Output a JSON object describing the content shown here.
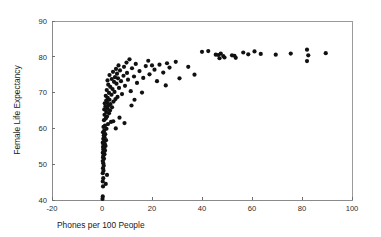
{
  "chart_data": {
    "type": "scatter",
    "title": "",
    "xlabel": "Phones per 100 People",
    "ylabel": "Female Life Expectancy",
    "xlim": [
      -20,
      100
    ],
    "ylim": [
      40,
      90
    ],
    "xticks": [
      -20,
      0,
      20,
      40,
      60,
      80,
      100
    ],
    "xticklabels": [
      "-20",
      "0",
      "20",
      "40",
      "60",
      "80",
      "100"
    ],
    "yticks": [
      40,
      50,
      60,
      70,
      80,
      90
    ],
    "yticklabels": [
      "40",
      "50",
      "60",
      "70",
      "80",
      "90"
    ],
    "grid": false,
    "legend": null,
    "marker": "filled-circle",
    "marker_color": "#111111",
    "marker_size": 2.1,
    "points": [
      [
        0.2,
        40.3
      ],
      [
        0.3,
        41.0
      ],
      [
        0.4,
        43.8
      ],
      [
        0.3,
        45.2
      ],
      [
        0.5,
        46.1
      ],
      [
        0.3,
        47.5
      ],
      [
        0.6,
        48.2
      ],
      [
        0.4,
        48.9
      ],
      [
        0.7,
        49.6
      ],
      [
        0.5,
        50.3
      ],
      [
        0.3,
        50.9
      ],
      [
        0.8,
        51.5
      ],
      [
        0.4,
        51.9
      ],
      [
        0.6,
        52.4
      ],
      [
        1.0,
        52.8
      ],
      [
        0.3,
        53.2
      ],
      [
        0.7,
        53.5
      ],
      [
        1.2,
        53.8
      ],
      [
        0.5,
        54.1
      ],
      [
        0.9,
        54.4
      ],
      [
        0.4,
        54.8
      ],
      [
        1.4,
        55.1
      ],
      [
        0.6,
        55.4
      ],
      [
        1.1,
        55.7
      ],
      [
        0.3,
        56.0
      ],
      [
        0.8,
        56.4
      ],
      [
        1.6,
        56.7
      ],
      [
        0.5,
        57.1
      ],
      [
        1.0,
        57.5
      ],
      [
        0.7,
        58.0
      ],
      [
        1.3,
        58.4
      ],
      [
        0.4,
        58.9
      ],
      [
        0.9,
        59.4
      ],
      [
        1.8,
        59.9
      ],
      [
        0.6,
        60.4
      ],
      [
        1.2,
        60.8
      ],
      [
        2.4,
        61.2
      ],
      [
        3.6,
        61.8
      ],
      [
        0.8,
        62.3
      ],
      [
        1.5,
        62.8
      ],
      [
        2.0,
        63.3
      ],
      [
        1.0,
        63.8
      ],
      [
        2.8,
        64.2
      ],
      [
        1.7,
        64.6
      ],
      [
        3.2,
        65.0
      ],
      [
        0.9,
        65.3
      ],
      [
        2.2,
        65.6
      ],
      [
        4.0,
        65.9
      ],
      [
        1.4,
        66.2
      ],
      [
        2.6,
        66.5
      ],
      [
        3.4,
        66.8
      ],
      [
        1.1,
        67.0
      ],
      [
        2.0,
        67.3
      ],
      [
        4.6,
        67.5
      ],
      [
        1.7,
        67.8
      ],
      [
        3.0,
        68.0
      ],
      [
        5.4,
        68.2
      ],
      [
        2.3,
        68.5
      ],
      [
        6.2,
        68.8
      ],
      [
        1.5,
        69.1
      ],
      [
        3.8,
        69.4
      ],
      [
        8.0,
        69.6
      ],
      [
        2.8,
        69.9
      ],
      [
        5.0,
        70.2
      ],
      [
        11.5,
        70.4
      ],
      [
        1.9,
        70.7
      ],
      [
        4.2,
        71.0
      ],
      [
        6.8,
        71.3
      ],
      [
        3.3,
        71.6
      ],
      [
        9.2,
        71.9
      ],
      [
        2.5,
        72.2
      ],
      [
        5.8,
        72.5
      ],
      [
        14.0,
        72.7
      ],
      [
        4.8,
        73.0
      ],
      [
        7.6,
        73.2
      ],
      [
        2.2,
        73.4
      ],
      [
        10.4,
        73.6
      ],
      [
        3.9,
        73.8
      ],
      [
        6.4,
        74.0
      ],
      [
        16.5,
        74.1
      ],
      [
        5.2,
        74.3
      ],
      [
        12.8,
        74.5
      ],
      [
        8.6,
        74.7
      ],
      [
        3.0,
        74.9
      ],
      [
        19.0,
        75.1
      ],
      [
        6.0,
        75.3
      ],
      [
        10.0,
        75.5
      ],
      [
        24.5,
        75.6
      ],
      [
        4.4,
        75.8
      ],
      [
        15.0,
        76.0
      ],
      [
        7.2,
        76.2
      ],
      [
        21.0,
        76.4
      ],
      [
        5.6,
        76.6
      ],
      [
        12.0,
        76.8
      ],
      [
        27.0,
        77.0
      ],
      [
        8.8,
        77.2
      ],
      [
        17.5,
        77.4
      ],
      [
        6.6,
        77.6
      ],
      [
        23.0,
        77.8
      ],
      [
        13.5,
        78.0
      ],
      [
        9.8,
        78.4
      ],
      [
        29.5,
        78.6
      ],
      [
        18.5,
        78.9
      ],
      [
        11.0,
        79.3
      ],
      [
        40.0,
        81.4
      ],
      [
        42.5,
        81.6
      ],
      [
        45.5,
        80.6
      ],
      [
        46.5,
        80.5
      ],
      [
        47.0,
        79.6
      ],
      [
        47.5,
        80.9
      ],
      [
        48.5,
        80.2
      ],
      [
        49.0,
        79.8
      ],
      [
        52.0,
        80.4
      ],
      [
        53.0,
        80.3
      ],
      [
        53.5,
        79.7
      ],
      [
        56.5,
        81.2
      ],
      [
        58.5,
        80.7
      ],
      [
        61.0,
        81.5
      ],
      [
        63.5,
        80.8
      ],
      [
        69.5,
        80.6
      ],
      [
        75.5,
        80.9
      ],
      [
        82.0,
        82.0
      ],
      [
        82.5,
        80.4
      ],
      [
        82.0,
        78.8
      ],
      [
        89.5,
        81.0
      ],
      [
        31.0,
        74.0
      ],
      [
        34.5,
        77.2
      ],
      [
        37.0,
        75.0
      ],
      [
        22.0,
        73.2
      ],
      [
        25.5,
        72.0
      ],
      [
        16.0,
        70.0
      ],
      [
        13.0,
        68.0
      ],
      [
        20.0,
        77.6
      ],
      [
        26.0,
        78.2
      ],
      [
        11.8,
        66.4
      ],
      [
        7.0,
        63.0
      ],
      [
        9.0,
        61.5
      ],
      [
        4.5,
        62.0
      ],
      [
        5.5,
        60.0
      ],
      [
        2.0,
        47.0
      ],
      [
        1.5,
        44.5
      ]
    ]
  },
  "axis": {
    "x_title": "Phones per 100 People",
    "y_title": "Female Life Expectancy"
  }
}
